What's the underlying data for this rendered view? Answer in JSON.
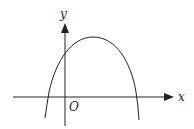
{
  "diagram": {
    "type": "function-graph",
    "axes": {
      "x_label": "x",
      "y_label": "y",
      "origin_label": "O"
    },
    "curve": {
      "shape": "parabola",
      "opens": "down",
      "vertex_quadrant": "I",
      "x_intercepts": [
        "negative",
        "positive"
      ],
      "y_intercept": "positive"
    },
    "colors": {
      "stroke": "#222222",
      "background": "#ffffff"
    }
  }
}
